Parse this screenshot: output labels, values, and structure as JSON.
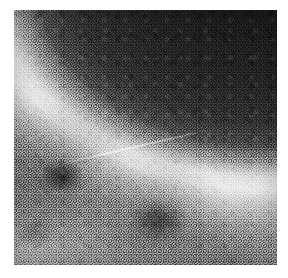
{
  "page": {
    "background_color": "#ffffff",
    "width": 288,
    "height": 278
  },
  "figure": {
    "name": "grayscale-micrograph",
    "caption": "",
    "plate": {
      "left": 14,
      "top": 10,
      "width": 263,
      "height": 255,
      "border_color": "#ffffff"
    },
    "palette": {
      "paper": "#ffffff",
      "dark_field": "#1b1b1b",
      "dark_field_deep": "#141414",
      "mid_matrix": "#8e8e8e",
      "bright_band": "#f2f2f2",
      "blob_shadow": "#2e2e2e"
    },
    "regions": [
      {
        "name": "dark-field",
        "label": "Dark field",
        "position": "upper-right",
        "mean_gray": 30
      },
      {
        "name": "bright-band",
        "label": "Bright interface band",
        "position": "diagonal, upper-left to lower-right",
        "mean_gray": 230
      },
      {
        "name": "gray-matrix",
        "label": "Speckled gray matrix",
        "position": "lower-left",
        "mean_gray": 142
      }
    ],
    "features": [
      {
        "name": "dark-blob-left",
        "label": "Dark inclusion",
        "cx_pct": 18,
        "cy_pct": 65
      },
      {
        "name": "dark-blob-center",
        "label": "Dark inclusion",
        "cx_pct": 55,
        "cy_pct": 82
      },
      {
        "name": "dark-blob-edge",
        "label": "Dark inclusion",
        "cx_pct": 8,
        "cy_pct": 87
      },
      {
        "name": "bright-filament",
        "label": "Bright filament",
        "cx_pct": 46,
        "cy_pct": 58
      }
    ],
    "texture": {
      "type": "film-grain",
      "grain_scale_px": 3,
      "noise_strength": 0.55
    }
  }
}
